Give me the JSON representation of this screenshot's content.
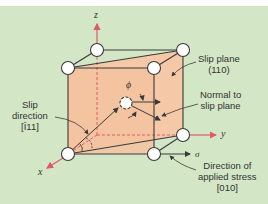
{
  "diagram": {
    "type": "crystal slip system (unit cell with slip plane, slip direction, and stress axis)",
    "colors": {
      "background": "#d3e6c6",
      "slip_plane_fill": "#f5c9a8",
      "axis_red": "#e05a6a",
      "edge": "#3a3a3a",
      "atom_fill": "#ffffff"
    },
    "axes": {
      "z": "z",
      "y": "y",
      "x": "x"
    },
    "labels": {
      "slip_plane_line1": "Slip plane",
      "slip_plane_line2": "(110)",
      "normal_line1": "Normal to",
      "normal_line2": "slip plane",
      "slip_dir_line1": "Slip",
      "slip_dir_line2": "direction",
      "slip_dir_line3": "[Ī11]",
      "stress_line1": "Direction of",
      "stress_line2": "applied stress",
      "stress_line3": "[010]",
      "phi": "ϕ",
      "lambda": "λ",
      "sigma": "σ"
    }
  }
}
